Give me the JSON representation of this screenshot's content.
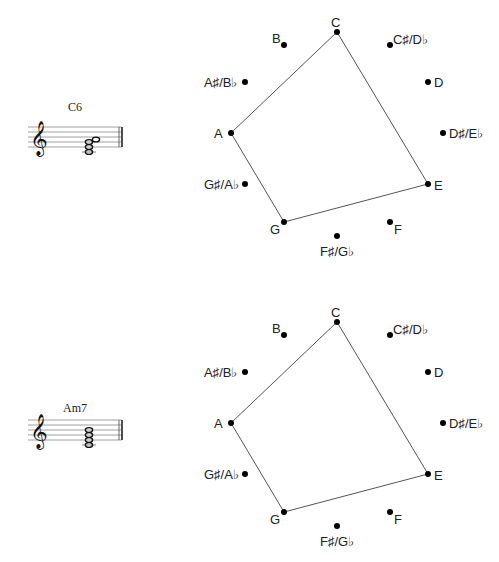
{
  "diagrams": [
    {
      "chord": "C6",
      "staff_notes": [
        "C4",
        "E4",
        "G4",
        "A4"
      ],
      "highlighted": [
        "C",
        "E",
        "G",
        "A"
      ]
    },
    {
      "chord": "Am7",
      "staff_notes": [
        "A3",
        "C4",
        "E4",
        "G4"
      ],
      "highlighted": [
        "C",
        "E",
        "G",
        "A"
      ]
    }
  ],
  "pitch_classes": [
    "C",
    "C♯/D♭",
    "D",
    "D♯/E♭",
    "E",
    "F",
    "F♯/G♭",
    "G",
    "G♯/A♭",
    "A",
    "A♯/B♭",
    "B"
  ],
  "colors": {
    "line": "#555555",
    "dot": "#000000",
    "text": "#222222"
  }
}
